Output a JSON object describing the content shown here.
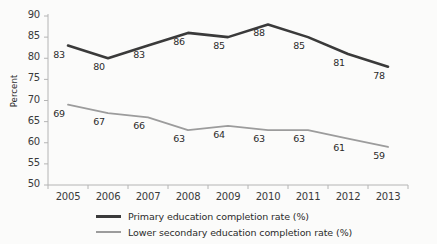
{
  "chart_data": {
    "type": "line",
    "title": "",
    "xlabel": "",
    "ylabel": "Percent",
    "categories": [
      "2005",
      "2006",
      "2007",
      "2008",
      "2009",
      "2010",
      "2011",
      "2012",
      "2013"
    ],
    "ylim": [
      50,
      90
    ],
    "yticks": [
      50,
      55,
      60,
      65,
      70,
      75,
      80,
      85,
      90
    ],
    "grid": false,
    "legend_position": "bottom",
    "series": [
      {
        "name": "Primary education completion rate (%)",
        "color": "#3a3a3a",
        "values": [
          83,
          80,
          83,
          86,
          85,
          88,
          85,
          81,
          78
        ],
        "labels": [
          "83",
          "80",
          "83",
          "86",
          "85",
          "88",
          "85",
          "81",
          "78"
        ]
      },
      {
        "name": "Lower secondary education completion rate (%)",
        "color": "#9c9c9c",
        "values": [
          69,
          67,
          66,
          63,
          64,
          63,
          63,
          61,
          59
        ],
        "labels": [
          "69",
          "67",
          "66",
          "63",
          "64",
          "63",
          "63",
          "61",
          "59"
        ]
      }
    ]
  },
  "axis": {
    "y_title": "Percent",
    "y_tick_labels": [
      "90",
      "85",
      "80",
      "75",
      "70",
      "65",
      "60",
      "55",
      "50"
    ],
    "x_tick_labels": [
      "2005",
      "2006",
      "2007",
      "2008",
      "2009",
      "2010",
      "2011",
      "2012",
      "2013"
    ]
  },
  "legend": {
    "items": [
      {
        "label": "Primary education completion rate (%)"
      },
      {
        "label": "Lower secondary education completion rate (%)"
      }
    ]
  }
}
